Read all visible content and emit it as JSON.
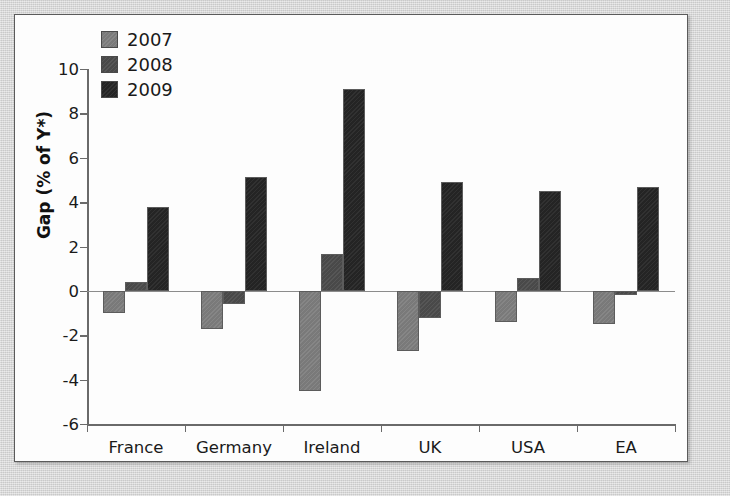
{
  "chart_data": {
    "type": "bar",
    "title": "",
    "subtitle": "",
    "xlabel": "",
    "ylabel": "Gap (% of Y*)",
    "categories": [
      "France",
      "Germany",
      "Ireland",
      "UK",
      "USA",
      "EA"
    ],
    "series": [
      {
        "name": "2007",
        "color": "#808080",
        "values": [
          -1.0,
          -1.7,
          -4.5,
          -2.7,
          -1.4,
          -1.5
        ]
      },
      {
        "name": "2008",
        "color": "#4d4d4d",
        "values": [
          0.4,
          -0.6,
          1.65,
          -1.2,
          0.6,
          -0.2
        ]
      },
      {
        "name": "2009",
        "color": "#262626",
        "values": [
          3.8,
          5.15,
          9.1,
          4.9,
          4.5,
          4.7
        ]
      }
    ],
    "ylim": [
      -6,
      10
    ],
    "yticks": [
      10,
      8,
      6,
      4,
      2,
      0,
      -2,
      -4,
      -6
    ],
    "ytick_labels": [
      "10",
      "8",
      "6",
      "4",
      "2",
      "0",
      "-2",
      "-4",
      "-6"
    ],
    "grid": false,
    "legend_position": "top-left",
    "legend_entries": [
      "2007",
      "2008",
      "2009"
    ],
    "zero_line": true
  },
  "figure": {
    "background_color": "#d9d9d9",
    "panel_color": "#fdfdfd",
    "border_color": "#5b5b5b",
    "axis_color": "#6a6a6a"
  }
}
